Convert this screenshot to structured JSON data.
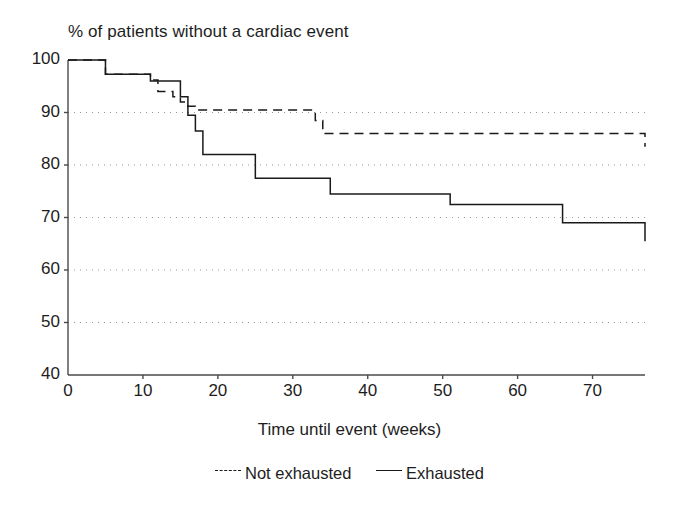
{
  "chart_data": {
    "type": "line",
    "title": "% of patients without a cardiac event",
    "xlabel": "Time until event (weeks)",
    "ylabel": "",
    "xlim": [
      0,
      77
    ],
    "ylim": [
      40,
      100
    ],
    "xticks": [
      0,
      10,
      20,
      30,
      40,
      50,
      60,
      70
    ],
    "yticks": [
      40,
      50,
      60,
      70,
      80,
      90,
      100
    ],
    "xtick_labels": [
      "0",
      "10",
      "20",
      "30",
      "40",
      "50",
      "60",
      "70"
    ],
    "ytick_labels": [
      "40",
      "50",
      "60",
      "70",
      "80",
      "90",
      "100"
    ],
    "grid": "horizontal-dotted",
    "legend_position": "below",
    "line_color": "#1a1a1a",
    "step_type": "post",
    "series": [
      {
        "name": "Not exhausted",
        "style": "dashed",
        "x": [
          0,
          3,
          5,
          11,
          12,
          14,
          15,
          16,
          17,
          31,
          33,
          34,
          73,
          77
        ],
        "y": [
          100,
          100,
          97.3,
          96.2,
          94.0,
          93.0,
          92.0,
          91.2,
          90.5,
          90.5,
          88.5,
          86.0,
          86.0,
          83.5
        ]
      },
      {
        "name": "Exhausted",
        "style": "solid",
        "x": [
          0,
          3,
          5,
          11,
          14,
          15,
          16,
          17,
          18,
          25,
          26,
          35,
          36,
          51,
          54,
          66,
          67,
          77
        ],
        "y": [
          100,
          100,
          97.3,
          96.0,
          96.0,
          93.0,
          89.5,
          86.5,
          82.0,
          77.5,
          77.5,
          74.5,
          74.5,
          72.5,
          72.5,
          69.0,
          69.0,
          65.5
        ]
      }
    ]
  },
  "legend": {
    "entries": [
      {
        "label": "Not exhausted",
        "style": "dashed"
      },
      {
        "label": "Exhausted",
        "style": "solid"
      }
    ]
  }
}
